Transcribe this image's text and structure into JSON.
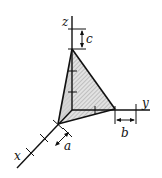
{
  "diagram": {
    "axes": {
      "x": {
        "label": "x"
      },
      "y": {
        "label": "y"
      },
      "z": {
        "label": "z"
      }
    },
    "dimensions": {
      "a": "a",
      "b": "b",
      "c": "c"
    },
    "colors": {
      "stroke": "#111111",
      "fill": "#d9d9d9",
      "hatch": "#888888"
    }
  }
}
